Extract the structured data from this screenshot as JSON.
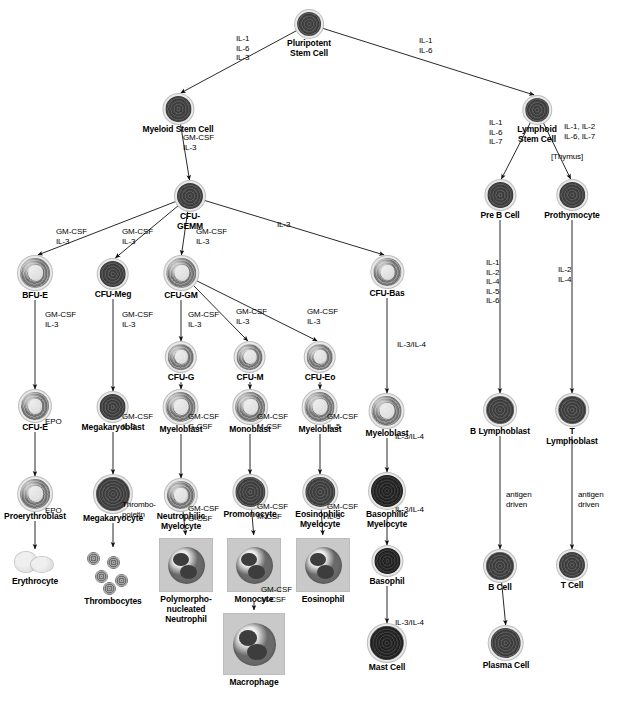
{
  "diagram": {
    "ink_color": "#000000",
    "cell_color": "#808080",
    "box_color": "#c9c9c9"
  },
  "nodes": [
    {
      "id": "pluripotent",
      "label": "Pluripotent\nStem Cell",
      "x": 309,
      "y": 12,
      "size": 24,
      "style": "dark"
    },
    {
      "id": "myeloid_stem",
      "label": "Myeloid Stem Cell",
      "x": 178,
      "y": 96,
      "size": 26,
      "style": "dark"
    },
    {
      "id": "lymphoid_stem",
      "label": "Lymphoid\nStem Cell",
      "x": 537,
      "y": 98,
      "size": 24,
      "style": "dark"
    },
    {
      "id": "cfu_gemm",
      "label": "CFU-\nGEMM",
      "x": 190,
      "y": 183,
      "size": 26,
      "style": "dark"
    },
    {
      "id": "pre_b_cell",
      "label": "Pre B Cell",
      "x": 500,
      "y": 182,
      "size": 26,
      "style": "dark"
    },
    {
      "id": "prothymocyte",
      "label": "Prothymocyte",
      "x": 572,
      "y": 182,
      "size": 26,
      "style": "dark"
    },
    {
      "id": "bfu_e",
      "label": "BFU-E",
      "x": 35,
      "y": 258,
      "size": 30,
      "style": "plainlight"
    },
    {
      "id": "cfu_meg",
      "label": "CFU-Meg",
      "x": 113,
      "y": 261,
      "size": 26,
      "style": "dark"
    },
    {
      "id": "cfu_gm",
      "label": "CFU-GM",
      "x": 181,
      "y": 258,
      "size": 30,
      "style": "plainlight"
    },
    {
      "id": "cfu_bas",
      "label": "CFU-Bas",
      "x": 387,
      "y": 258,
      "size": 28,
      "style": "plainlight"
    },
    {
      "id": "cfu_g",
      "label": "CFU-G",
      "x": 181,
      "y": 344,
      "size": 26,
      "style": "plainlight"
    },
    {
      "id": "cfu_m",
      "label": "CFU-M",
      "x": 250,
      "y": 344,
      "size": 26,
      "style": "plainlight"
    },
    {
      "id": "cfu_eo",
      "label": "CFU-Eo",
      "x": 320,
      "y": 344,
      "size": 26,
      "style": "plainlight"
    },
    {
      "id": "cfu_e",
      "label": "CFU-E",
      "x": 35,
      "y": 392,
      "size": 28,
      "style": "plainlight"
    },
    {
      "id": "megakaryoblast",
      "label": "Megakaryoblast",
      "x": 113,
      "y": 394,
      "size": 26,
      "style": "dark"
    },
    {
      "id": "myeloblast_g",
      "label": "Myeloblast",
      "x": 181,
      "y": 392,
      "size": 30,
      "style": "plainlight"
    },
    {
      "id": "monoblast",
      "label": "Monoblast",
      "x": 250,
      "y": 392,
      "size": 30,
      "style": "plainlight"
    },
    {
      "id": "myeloblast_eo",
      "label": "Myeloblast",
      "x": 320,
      "y": 392,
      "size": 30,
      "style": "plainlight"
    },
    {
      "id": "myeloblast_bas",
      "label": "Myeloblast",
      "x": 387,
      "y": 396,
      "size": 30,
      "style": "plainlight"
    },
    {
      "id": "b_lymphoblast",
      "label": "B Lymphoblast",
      "x": 500,
      "y": 396,
      "size": 28,
      "style": "dark"
    },
    {
      "id": "t_lymphoblast",
      "label": "T Lymphoblast",
      "x": 572,
      "y": 396,
      "size": 28,
      "style": "dark"
    },
    {
      "id": "proerythroblast",
      "label": "Proerythroblast",
      "x": 35,
      "y": 479,
      "size": 30,
      "style": "plainlight"
    },
    {
      "id": "megakaryocyte",
      "label": "Megakaryocyte",
      "x": 113,
      "y": 477,
      "size": 34,
      "style": "dark"
    },
    {
      "id": "neutrophilic_myelo",
      "label": "Neutrophilic\nMyelocyte",
      "x": 181,
      "y": 481,
      "size": 28,
      "style": "plainlight"
    },
    {
      "id": "promonocyte",
      "label": "Promonocyte",
      "x": 250,
      "y": 477,
      "size": 30,
      "style": "dark"
    },
    {
      "id": "eosinophilic_myelo",
      "label": "Eosinophilic\nMyelocyte",
      "x": 320,
      "y": 477,
      "size": 30,
      "style": "dark"
    },
    {
      "id": "basophilic_myelo",
      "label": "Basophilic\nMyelocyte",
      "x": 387,
      "y": 475,
      "size": 32,
      "style": "vdark"
    },
    {
      "id": "b_cell",
      "label": "B Cell",
      "x": 500,
      "y": 552,
      "size": 28,
      "style": "dark"
    },
    {
      "id": "t_cell",
      "label": "T Cell",
      "x": 572,
      "y": 552,
      "size": 26,
      "style": "dark"
    },
    {
      "id": "erythrocyte",
      "label": "Erythrocyte",
      "x": 35,
      "y": 552,
      "size": 36,
      "style": "erythrocyte"
    },
    {
      "id": "thrombocytes",
      "label": "Thrombocytes",
      "x": 113,
      "y": 550,
      "size": 44,
      "style": "platelets"
    },
    {
      "id": "pmn_neutrophil",
      "label": "Polymorpho-\nnucleated\nNeutrophil",
      "x": 186,
      "y": 538,
      "size": 52,
      "style": "boxed"
    },
    {
      "id": "monocyte",
      "label": "Monocyte",
      "x": 254,
      "y": 538,
      "size": 52,
      "style": "boxed"
    },
    {
      "id": "eosinophil",
      "label": "Eosinophil",
      "x": 323,
      "y": 538,
      "size": 52,
      "style": "boxed"
    },
    {
      "id": "basophil",
      "label": "Basophil",
      "x": 387,
      "y": 548,
      "size": 26,
      "style": "vdark"
    },
    {
      "id": "macrophage",
      "label": "Macrophage",
      "x": 254,
      "y": 613,
      "size": 60,
      "style": "boxed"
    },
    {
      "id": "mast_cell",
      "label": "Mast Cell",
      "x": 387,
      "y": 626,
      "size": 34,
      "style": "vdark"
    },
    {
      "id": "plasma_cell",
      "label": "Plasma Cell",
      "x": 506,
      "y": 628,
      "size": 30,
      "style": "dark"
    }
  ],
  "cytokine_labels": [
    {
      "id": "lbl-pluri-left",
      "text": "IL-1\nIL-6\nIL-3",
      "x": 236,
      "y": 34,
      "align": "left"
    },
    {
      "id": "lbl-pluri-right",
      "text": "IL-1\nIL-6",
      "x": 419,
      "y": 36,
      "align": "left"
    },
    {
      "id": "lbl-myeloid-gm",
      "text": "GM-CSF\nIL-3",
      "x": 183,
      "y": 133,
      "align": "left"
    },
    {
      "id": "lbl-lymph-left",
      "text": "IL-1\nIL-6\nIL-7",
      "x": 489,
      "y": 118,
      "align": "left"
    },
    {
      "id": "lbl-lymph-right",
      "text": "IL-1, IL-2\nIL-6, IL-7",
      "x": 564,
      "y": 122,
      "align": "left"
    },
    {
      "id": "lbl-thymus",
      "text": "[Thymus]",
      "x": 551,
      "y": 152,
      "align": "left"
    },
    {
      "id": "lbl-bfue",
      "text": "GM-CSF\nIL-3",
      "x": 56,
      "y": 227,
      "align": "left"
    },
    {
      "id": "lbl-cfumeg",
      "text": "GM-CSF\nIL-3",
      "x": 122,
      "y": 227,
      "align": "left"
    },
    {
      "id": "lbl-cfugm-in",
      "text": "GM-CSF\nIL-3",
      "x": 196,
      "y": 227,
      "align": "left"
    },
    {
      "id": "lbl-cfubas-in",
      "text": "IL-3",
      "x": 277,
      "y": 220,
      "align": "left"
    },
    {
      "id": "lbl-bfue-cfue",
      "text": "GM-CSF\nIL-3",
      "x": 45,
      "y": 310,
      "align": "left"
    },
    {
      "id": "lbl-meg-blast",
      "text": "GM-CSF\nIL-3",
      "x": 122,
      "y": 310,
      "align": "left"
    },
    {
      "id": "lbl-cfug",
      "text": "GM-CSF\nIL-3",
      "x": 188,
      "y": 310,
      "align": "left"
    },
    {
      "id": "lbl-cfum",
      "text": "GM-CSF\nIL-3",
      "x": 236,
      "y": 307,
      "align": "left"
    },
    {
      "id": "lbl-cfueo",
      "text": "GM-CSF\nIL-3",
      "x": 307,
      "y": 307,
      "align": "left"
    },
    {
      "id": "lbl-bas-myelo",
      "text": "IL-3/IL-4",
      "x": 397,
      "y": 340,
      "align": "left"
    },
    {
      "id": "lbl-preb",
      "text": "IL-1\nIL-2\nIL-4\nIL-5\nIL-6",
      "x": 486,
      "y": 258,
      "align": "left"
    },
    {
      "id": "lbl-prothy",
      "text": "IL-2\nIL-4",
      "x": 558,
      "y": 265,
      "align": "left"
    },
    {
      "id": "lbl-cfue-pro",
      "text": "EPO",
      "x": 45,
      "y": 417,
      "align": "left"
    },
    {
      "id": "lbl-megakaryo",
      "text": "GM-CSF\nIL-3",
      "x": 122,
      "y": 412,
      "align": "left"
    },
    {
      "id": "lbl-myeloblast-g",
      "text": "GM-CSF\nG-CSF",
      "x": 188,
      "y": 412,
      "align": "left"
    },
    {
      "id": "lbl-monoblast",
      "text": "GM-CSF\nM-CSF",
      "x": 257,
      "y": 412,
      "align": "left"
    },
    {
      "id": "lbl-myeloblast-eo",
      "text": "GM-CSF\nIL-5",
      "x": 327,
      "y": 412,
      "align": "left"
    },
    {
      "id": "lbl-myeloblast-bas",
      "text": "IL-3/IL-4",
      "x": 395,
      "y": 432,
      "align": "left"
    },
    {
      "id": "lbl-pro-ery",
      "text": "EPO",
      "x": 45,
      "y": 506,
      "align": "left"
    },
    {
      "id": "lbl-thrombo",
      "text": "Thrombo-\npoietin",
      "x": 122,
      "y": 500,
      "align": "left"
    },
    {
      "id": "lbl-neut-pmn",
      "text": "GM-CSF\nG-CSF",
      "x": 188,
      "y": 504,
      "align": "left"
    },
    {
      "id": "lbl-promono",
      "text": "GM-CSF\nM-CSF",
      "x": 257,
      "y": 502,
      "align": "left"
    },
    {
      "id": "lbl-eos-myelo",
      "text": "GM-CSF\nIL-5",
      "x": 327,
      "y": 502,
      "align": "left"
    },
    {
      "id": "lbl-baso-myelo",
      "text": "IL-3/IL-4",
      "x": 395,
      "y": 505,
      "align": "left"
    },
    {
      "id": "lbl-b-antigen",
      "text": "antigen\ndriven",
      "x": 506,
      "y": 490,
      "align": "left"
    },
    {
      "id": "lbl-t-antigen",
      "text": "antigen\ndriven",
      "x": 578,
      "y": 490,
      "align": "left"
    },
    {
      "id": "lbl-mono-macro",
      "text": "GM-CSF\nM-CSF",
      "x": 261,
      "y": 585,
      "align": "left"
    },
    {
      "id": "lbl-baso-mast",
      "text": "IL-3/IL-4",
      "x": 395,
      "y": 618,
      "align": "left"
    }
  ],
  "edges": [
    {
      "from": "pluripotent",
      "to": "myeloid_stem"
    },
    {
      "from": "pluripotent",
      "to": "lymphoid_stem"
    },
    {
      "from": "myeloid_stem",
      "to": "cfu_gemm"
    },
    {
      "from": "lymphoid_stem",
      "to": "pre_b_cell"
    },
    {
      "from": "lymphoid_stem",
      "to": "prothymocyte"
    },
    {
      "from": "cfu_gemm",
      "to": "bfu_e"
    },
    {
      "from": "cfu_gemm",
      "to": "cfu_meg"
    },
    {
      "from": "cfu_gemm",
      "to": "cfu_gm"
    },
    {
      "from": "cfu_gemm",
      "to": "cfu_bas"
    },
    {
      "from": "bfu_e",
      "to": "cfu_e"
    },
    {
      "from": "cfu_meg",
      "to": "megakaryoblast"
    },
    {
      "from": "cfu_gm",
      "to": "cfu_g"
    },
    {
      "from": "cfu_gm",
      "to": "cfu_m"
    },
    {
      "from": "cfu_gm",
      "to": "cfu_eo"
    },
    {
      "from": "cfu_g",
      "to": "myeloblast_g"
    },
    {
      "from": "cfu_m",
      "to": "monoblast"
    },
    {
      "from": "cfu_eo",
      "to": "myeloblast_eo"
    },
    {
      "from": "cfu_bas",
      "to": "myeloblast_bas"
    },
    {
      "from": "pre_b_cell",
      "to": "b_lymphoblast"
    },
    {
      "from": "prothymocyte",
      "to": "t_lymphoblast"
    },
    {
      "from": "cfu_e",
      "to": "proerythroblast"
    },
    {
      "from": "megakaryoblast",
      "to": "megakaryocyte"
    },
    {
      "from": "myeloblast_g",
      "to": "neutrophilic_myelo"
    },
    {
      "from": "monoblast",
      "to": "promonocyte"
    },
    {
      "from": "myeloblast_eo",
      "to": "eosinophilic_myelo"
    },
    {
      "from": "myeloblast_bas",
      "to": "basophilic_myelo"
    },
    {
      "from": "proerythroblast",
      "to": "erythrocyte"
    },
    {
      "from": "megakaryocyte",
      "to": "thrombocytes"
    },
    {
      "from": "neutrophilic_myelo",
      "to": "pmn_neutrophil"
    },
    {
      "from": "promonocyte",
      "to": "monocyte"
    },
    {
      "from": "eosinophilic_myelo",
      "to": "eosinophil"
    },
    {
      "from": "basophilic_myelo",
      "to": "basophil"
    },
    {
      "from": "b_lymphoblast",
      "to": "b_cell"
    },
    {
      "from": "t_lymphoblast",
      "to": "t_cell"
    },
    {
      "from": "monocyte",
      "to": "macrophage"
    },
    {
      "from": "basophil",
      "to": "mast_cell"
    },
    {
      "from": "b_cell",
      "to": "plasma_cell"
    }
  ]
}
